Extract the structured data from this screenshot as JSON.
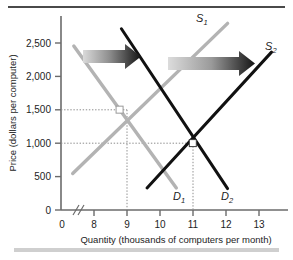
{
  "figure": {
    "background": "#ffffff",
    "top_rule_color": "#4a4a4a",
    "bottom_rule_color": "#cfcfcf"
  },
  "chart_data": {
    "type": "line",
    "title": "",
    "xlabel": "Quantity (thousands of computers per month)",
    "ylabel": "Price (dollars per computer)",
    "xlim": [
      7.4,
      13.6
    ],
    "ylim": [
      0,
      2900
    ],
    "xticks": [
      "0",
      "8",
      "9",
      "10",
      "11",
      "12",
      "13"
    ],
    "yticks": [
      "0",
      "500",
      "1,000",
      "1,500",
      "2,000",
      "2,500"
    ],
    "ytick_values": [
      0,
      500,
      1000,
      1500,
      2000,
      2500
    ],
    "xtick_values": [
      8,
      9,
      10,
      11,
      12,
      13
    ],
    "axis_break": true,
    "axis_break_label": "//",
    "grid": false,
    "legend": "inline-curve-labels",
    "series": [
      {
        "name": "D1",
        "label": "D",
        "sub": "1",
        "role": "demand-original",
        "color": "#b3b3b3",
        "x": [
          7.75,
          10.55
        ],
        "y": [
          2450,
          330
        ]
      },
      {
        "name": "S1",
        "label": "S",
        "sub": "1",
        "role": "supply-original",
        "color": "#b3b3b3",
        "x": [
          7.72,
          11.95
        ],
        "y": [
          545,
          2790
        ]
      },
      {
        "name": "D2",
        "label": "D",
        "sub": "2",
        "role": "demand-new",
        "color": "#111111",
        "x": [
          9.05,
          11.95
        ],
        "y": [
          2710,
          320
        ]
      },
      {
        "name": "S2",
        "label": "S",
        "sub": "2",
        "role": "supply-new",
        "color": "#111111",
        "x": [
          9.75,
          13.15
        ],
        "y": [
          330,
          2360
        ]
      }
    ],
    "equilibria": [
      {
        "name": "equilibrium-1",
        "x": 9,
        "y": 1500,
        "quantity": 9,
        "price": 1500
      },
      {
        "name": "equilibrium-2",
        "x": 11,
        "y": 1000,
        "quantity": 11,
        "price": 1000
      }
    ],
    "guide_lines": [
      {
        "name": "price-guide-1500",
        "price": 1500,
        "quantity": 9
      },
      {
        "name": "price-guide-1000",
        "price": 1000,
        "quantity": 11
      }
    ],
    "annotations": [
      {
        "name": "demand-shift-arrow",
        "type": "arrow",
        "direction": "right",
        "gradient_from": "#d6d6d6",
        "gradient_to": "#1a1a1a"
      },
      {
        "name": "supply-shift-arrow",
        "type": "arrow",
        "direction": "right",
        "gradient_from": "#d6d6d6",
        "gradient_to": "#1a1a1a"
      }
    ]
  }
}
